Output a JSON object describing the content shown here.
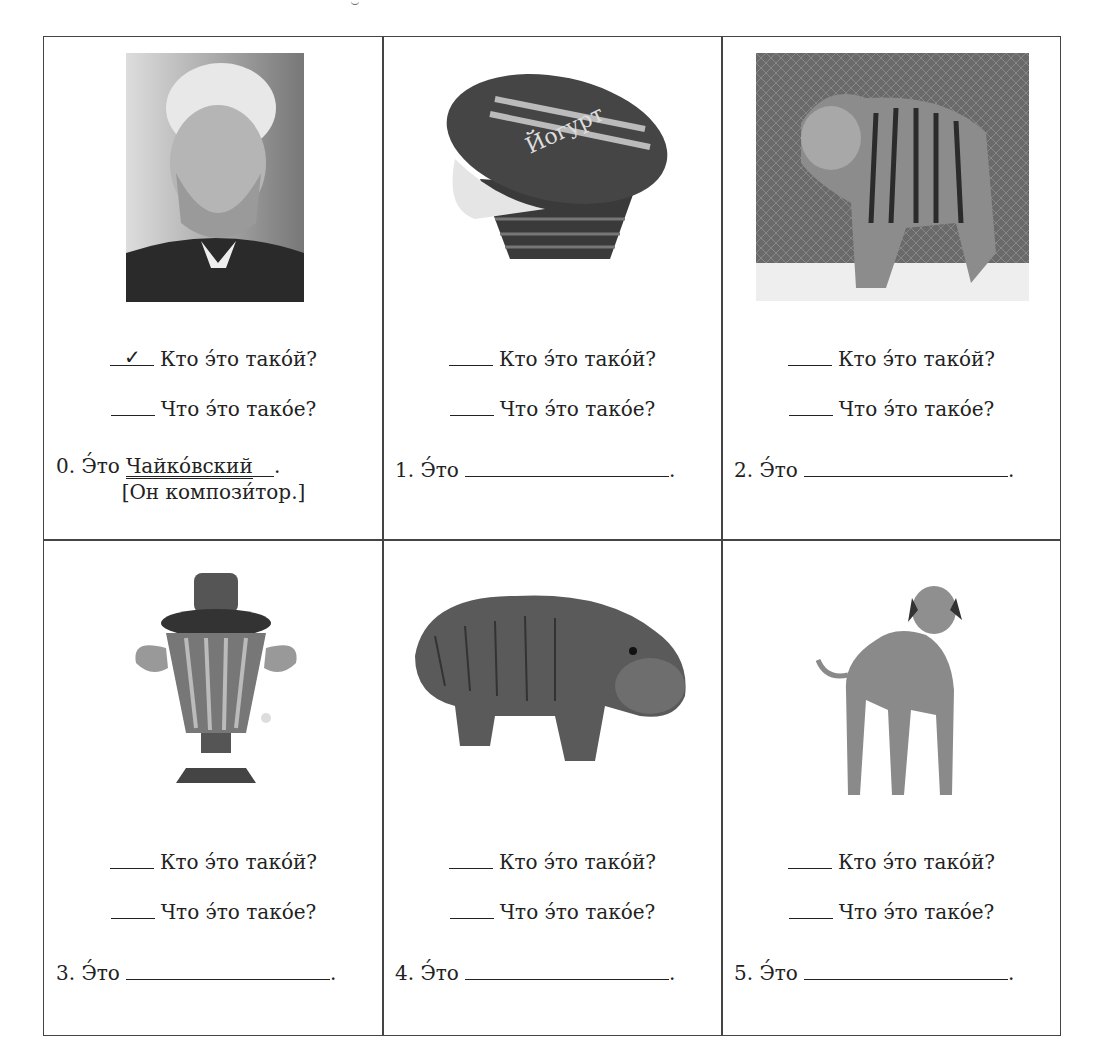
{
  "worksheet": {
    "question_who": "Кто э́то тако́й?",
    "question_what": "Что э́то тако́е?",
    "answer_prefix": "Э́то",
    "check_mark": "✓",
    "period": ".",
    "cells": [
      {
        "number": "0.",
        "image": "portrait of Tchaikovsky",
        "checked": "who",
        "answer": "Чайко́вский",
        "note": "[Он компози́тор.]"
      },
      {
        "number": "1.",
        "image": "yogurt cup",
        "checked": "",
        "answer": "",
        "note": ""
      },
      {
        "number": "2.",
        "image": "tiger",
        "checked": "",
        "answer": "",
        "note": ""
      },
      {
        "number": "3.",
        "image": "samovar",
        "checked": "",
        "answer": "",
        "note": ""
      },
      {
        "number": "4.",
        "image": "hippopotamus",
        "checked": "",
        "answer": "",
        "note": ""
      },
      {
        "number": "5.",
        "image": "dog",
        "checked": "",
        "answer": "",
        "note": ""
      }
    ]
  },
  "yogurt_label": {
    "brand": "Простоквашино",
    "product": "Йогурт",
    "fat": "2,5%"
  }
}
